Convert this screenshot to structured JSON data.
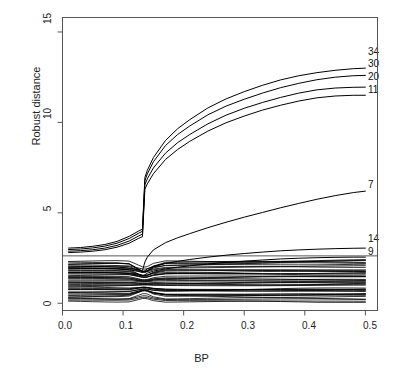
{
  "chart_data": {
    "type": "line",
    "title": "",
    "xlabel": "BP",
    "ylabel": "Robust distance",
    "xlim": [
      0.0,
      0.52
    ],
    "ylim": [
      -0.4,
      15.8
    ],
    "xticks": [
      "0.0",
      "0.1",
      "0.2",
      "0.3",
      "0.4",
      "0.5"
    ],
    "xtick_values": [
      0.0,
      0.1,
      0.2,
      0.3,
      0.4,
      0.5
    ],
    "yticks": [
      "0",
      "5",
      "10",
      "15"
    ],
    "ytick_values": [
      0,
      5,
      10,
      15
    ],
    "grid": false,
    "legend": "none",
    "annotations": [
      {
        "label": "34",
        "x": 0.5,
        "y": 13.0
      },
      {
        "label": "30",
        "x": 0.5,
        "y": 12.6
      },
      {
        "label": "20",
        "x": 0.5,
        "y": 11.95
      },
      {
        "label": "11",
        "x": 0.5,
        "y": 11.5
      },
      {
        "label": "7",
        "x": 0.5,
        "y": 6.2
      },
      {
        "label": "14",
        "x": 0.5,
        "y": 3.05
      },
      {
        "label": "9",
        "x": 0.5,
        "y": 2.55
      }
    ],
    "reference_line": {
      "orientation": "horizontal",
      "y": 2.62,
      "label": ""
    },
    "x": [
      0.01,
      0.03,
      0.05,
      0.07,
      0.09,
      0.11,
      0.125,
      0.132,
      0.136,
      0.14,
      0.15,
      0.17,
      0.19,
      0.21,
      0.24,
      0.27,
      0.3,
      0.33,
      0.36,
      0.39,
      0.42,
      0.45,
      0.48,
      0.5
    ],
    "series": [
      {
        "name": "34",
        "labeled": true,
        "values": [
          3.05,
          3.08,
          3.15,
          3.25,
          3.42,
          3.7,
          3.98,
          4.1,
          6.95,
          7.35,
          8.05,
          9.0,
          9.65,
          10.15,
          10.8,
          11.3,
          11.7,
          12.05,
          12.35,
          12.58,
          12.75,
          12.88,
          12.97,
          13.0
        ]
      },
      {
        "name": "30",
        "labeled": true,
        "values": [
          2.97,
          3.0,
          3.06,
          3.16,
          3.32,
          3.58,
          3.86,
          3.98,
          6.78,
          7.15,
          7.82,
          8.72,
          9.33,
          9.8,
          10.42,
          10.9,
          11.28,
          11.62,
          11.92,
          12.16,
          12.36,
          12.5,
          12.58,
          12.6
        ]
      },
      {
        "name": "20",
        "labeled": true,
        "values": [
          2.88,
          2.91,
          2.96,
          3.05,
          3.2,
          3.44,
          3.71,
          3.82,
          6.55,
          6.88,
          7.48,
          8.3,
          8.88,
          9.33,
          9.92,
          10.4,
          10.78,
          11.1,
          11.38,
          11.62,
          11.8,
          11.9,
          11.94,
          11.95
        ]
      },
      {
        "name": "11",
        "labeled": true,
        "values": [
          2.8,
          2.83,
          2.88,
          2.96,
          3.1,
          3.32,
          3.58,
          3.68,
          6.3,
          6.6,
          7.16,
          7.95,
          8.5,
          8.95,
          9.52,
          9.98,
          10.35,
          10.68,
          10.95,
          11.18,
          11.36,
          11.46,
          11.5,
          11.5
        ]
      },
      {
        "name": "7",
        "labeled": true,
        "values": [
          2.05,
          2.04,
          2.03,
          2.02,
          2.0,
          1.95,
          1.86,
          1.8,
          2.28,
          2.55,
          2.95,
          3.35,
          3.62,
          3.85,
          4.18,
          4.48,
          4.76,
          5.02,
          5.28,
          5.52,
          5.75,
          5.95,
          6.12,
          6.2
        ]
      },
      {
        "name": "14",
        "labeled": true,
        "values": [
          1.95,
          1.94,
          1.93,
          1.92,
          1.9,
          1.85,
          1.76,
          1.7,
          1.8,
          1.9,
          2.05,
          2.2,
          2.32,
          2.42,
          2.55,
          2.66,
          2.75,
          2.83,
          2.9,
          2.95,
          2.99,
          3.02,
          3.04,
          3.05
        ]
      },
      {
        "name": "9",
        "labeled": true,
        "values": [
          1.7,
          1.7,
          1.7,
          1.7,
          1.68,
          1.64,
          1.56,
          1.5,
          1.58,
          1.66,
          1.78,
          1.9,
          1.99,
          2.07,
          2.17,
          2.26,
          2.33,
          2.39,
          2.45,
          2.49,
          2.52,
          2.54,
          2.55,
          2.55
        ]
      }
    ],
    "bulk_description": "Approximately 40 unlabeled observation curves forming a dense band between about 0.1 and 2.3 robust distance, converging near BP = 0.135"
  },
  "axes": {
    "x_title": "BP",
    "y_title": "Robust distance"
  }
}
